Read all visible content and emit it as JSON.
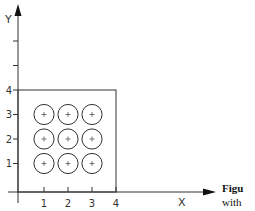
{
  "diagram": {
    "x_axis_label": "X",
    "y_axis_label": "Y",
    "x_ticks": [
      {
        "value": 1,
        "label": "1"
      },
      {
        "value": 2,
        "label": "2"
      },
      {
        "value": 3,
        "label": "3"
      },
      {
        "value": 4,
        "label": "4"
      }
    ],
    "y_ticks": [
      {
        "value": 1,
        "label": "1"
      },
      {
        "value": 2,
        "label": "2"
      },
      {
        "value": 3,
        "label": "3"
      },
      {
        "value": 4,
        "label": "4"
      },
      {
        "value": 6,
        "label": ""
      },
      {
        "value": 5,
        "label": ""
      }
    ],
    "boundary_box": {
      "x_min": 0,
      "y_min": 0,
      "x_max": 4,
      "y_max": 4
    },
    "circles": {
      "radius_units": 0.42,
      "centers": [
        [
          1,
          3
        ],
        [
          2,
          3
        ],
        [
          3,
          3
        ],
        [
          1,
          2
        ],
        [
          2,
          2
        ],
        [
          3,
          2
        ],
        [
          1,
          1
        ],
        [
          2,
          1
        ],
        [
          3,
          1
        ]
      ],
      "center_marker": "plus"
    }
  },
  "caption": {
    "line1": "Figu",
    "line2": "with"
  }
}
